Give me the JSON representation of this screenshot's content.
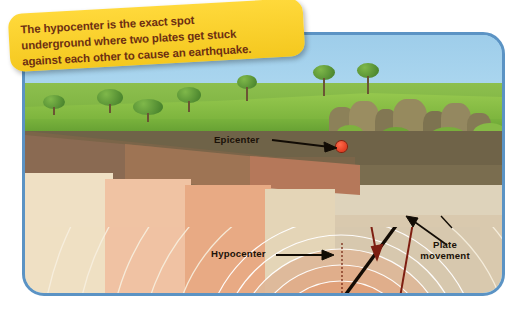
{
  "callout": {
    "text": "The hypocenter is the exact spot underground where two plates get stuck against each other to cause an earthquake.",
    "line1": "The hypocenter is the exact spot",
    "line2": "underground where two plates get stuck",
    "line3": "against each other to cause an earthquake.",
    "bg_color": "#ffd93b",
    "text_color": "#6d2f12"
  },
  "labels": {
    "epicenter": "Epicenter",
    "hypocenter": "Hypocenter",
    "plate_movement_l1": "Plate",
    "plate_movement_l2": "movement"
  },
  "diagram": {
    "epicenter_point": {
      "x": 339,
      "y": 146,
      "color": "#e8301c"
    },
    "hypocenter_point": {
      "x": 338,
      "y": 258,
      "color": "#e8301c"
    },
    "fault_line_color": "#1a1208",
    "plate_arrow_color": "#7e1f12",
    "wave_ring_color": "#ffffff",
    "panel_border_color": "#5b93c4",
    "sky_color": "#a8d4ef",
    "grass_color": "#7fb63f"
  },
  "strata": [
    {
      "name": "topsoil-dark",
      "color": "#6f6348"
    },
    {
      "name": "subsoil-olive",
      "color": "#7a6d4f"
    },
    {
      "name": "sand-cream",
      "color": "#ded3bb"
    },
    {
      "name": "clay-tan",
      "color": "#d9c9ae"
    },
    {
      "name": "rock-salmon",
      "color": "#e0a98c"
    },
    {
      "name": "core-orange",
      "color": "#e06a3c"
    }
  ]
}
